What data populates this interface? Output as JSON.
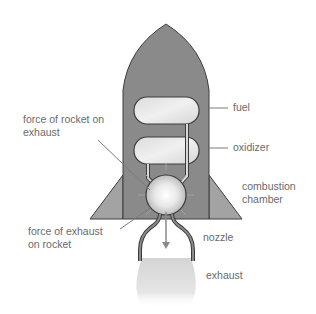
{
  "diagram": {
    "labels": {
      "fuel": "fuel",
      "oxidizer": "oxidizer",
      "combustion_chamber_line1": "combustion",
      "combustion_chamber_line2": "chamber",
      "nozzle": "nozzle",
      "exhaust": "exhaust",
      "force_rocket_on_exhaust_line1": "force of rocket on",
      "force_rocket_on_exhaust_line2": "exhaust",
      "force_exhaust_on_rocket_line1": "force of exhaust",
      "force_exhaust_on_rocket_line2": "on rocket"
    },
    "colors": {
      "body": "#8a8a8a",
      "body_dark": "#7c7c7c",
      "fin": "#a3a3a3",
      "outline": "#3c3c3c",
      "tank_fill": "#e6e6e6",
      "leader_line": "#7a7a7a",
      "text": "#6a6a6a",
      "exhaust": "#d8d8d8"
    }
  }
}
